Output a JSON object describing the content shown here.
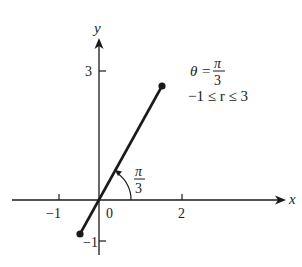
{
  "diagram": {
    "axes": {
      "x_label": "x",
      "y_label": "y",
      "x_ticks": [
        {
          "value": -1,
          "label": "−1"
        },
        {
          "value": 0,
          "label": "0"
        },
        {
          "value": 2,
          "label": "2"
        }
      ],
      "y_ticks": [
        {
          "value": 3,
          "label": "3"
        },
        {
          "value": -1,
          "label": "−1"
        }
      ]
    },
    "equation": {
      "theta_lhs": "θ =",
      "theta_num": "π",
      "theta_den": "3",
      "range": "−1 ≤ r ≤ 3"
    },
    "angle_label": {
      "num": "π",
      "den": "3"
    },
    "segment": {
      "theta": "pi/3",
      "r_min": -1,
      "r_max": 3,
      "start_point": "(-0.5, -0.866)",
      "end_point": "(1.5, 2.598)"
    },
    "colors": {
      "ink": "#1a1a1a",
      "background": "#ffffff"
    }
  }
}
